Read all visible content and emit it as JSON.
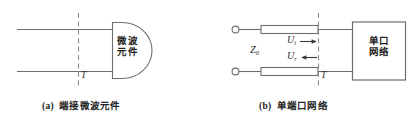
{
  "figure": {
    "panel_a": {
      "caption_index": "(a)",
      "caption_text": "端接微波元件",
      "component_label_line1": "微波",
      "component_label_line2": "元件",
      "reference_plane_label": "T"
    },
    "panel_b": {
      "caption_index": "(b)",
      "caption_text": "单端口网络",
      "network_label_line1": "单口",
      "network_label_line2": "网络",
      "impedance_label": "Z",
      "impedance_subscript": "0",
      "incident_wave_label": "U",
      "incident_wave_subscript": "i",
      "reflected_wave_label": "U",
      "reflected_wave_subscript": "r",
      "reference_plane_label": "T"
    }
  },
  "style": {
    "line_color": "#6e6e6e",
    "shape_stroke": "#6e6e6e",
    "dash_color": "#8a8a8a",
    "arrow_color": "#3a3a3a",
    "text_color": "#232323",
    "background": "#ffffff"
  },
  "icons": {
    "terminal_top": "terminal-circle-icon",
    "terminal_bottom": "terminal-circle-icon",
    "incident_arrow": "arrow-right-icon",
    "reflected_arrow": "arrow-left-icon"
  }
}
